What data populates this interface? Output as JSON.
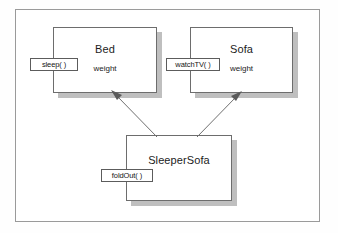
{
  "diagram": {
    "title_present": false,
    "type": "uml-class-diagram",
    "frame": {
      "name": "figure-frame"
    },
    "colors": {
      "box_border": "#6d6d6d",
      "box_fill": "#ffffff",
      "shadow": "#bfbfbf",
      "frame_border": "#9a9a9a",
      "arrow": "#6f6f6f",
      "text": "#1c1c1c"
    },
    "classes": [
      {
        "id": "bed",
        "name": "Bed",
        "attribute": "weight",
        "operation": "sleep( )"
      },
      {
        "id": "sofa",
        "name": "Sofa",
        "attribute": "weight",
        "operation": "watchTV( )"
      },
      {
        "id": "sleepersofa",
        "name": "SleeperSofa",
        "attribute": "",
        "operation": "foldOut( )"
      }
    ],
    "relationships": [
      {
        "id": "sleepersofa-to-bed",
        "from": "SleeperSofa",
        "to": "Bed",
        "kind": "generalization-arrow"
      },
      {
        "id": "sleepersofa-to-sofa",
        "from": "SleeperSofa",
        "to": "Sofa",
        "kind": "generalization-arrow"
      }
    ]
  }
}
